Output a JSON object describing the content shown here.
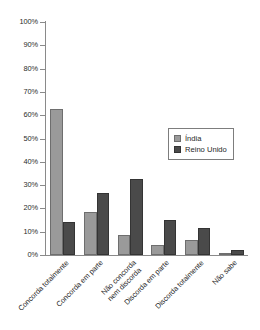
{
  "chart_data": {
    "type": "bar",
    "title": "",
    "subtitle": "",
    "xlabel": "",
    "ylabel": "",
    "ylim": [
      0,
      100
    ],
    "y_tick_labels": [
      "100%",
      "90%",
      "80%",
      "70%",
      "60%",
      "50%",
      "40%",
      "30%",
      "20%",
      "10%",
      "0%"
    ],
    "y_tick_values": [
      100,
      90,
      80,
      70,
      60,
      50,
      40,
      30,
      20,
      10,
      0
    ],
    "grid": false,
    "legend_position": "center-right",
    "categories": [
      "Concorda totalmente",
      "Concorda em parte",
      "Não concorda nem discorda",
      "Discorda em parte",
      "Discorda totalmente",
      "Não sabe"
    ],
    "category_lines": [
      [
        "Concorda totalmente"
      ],
      [
        "Concorda em parte"
      ],
      [
        "Não concorda",
        "nem discorda"
      ],
      [
        "Discorda em parte"
      ],
      [
        "Discorda totalmente"
      ],
      [
        "Não sabe"
      ]
    ],
    "series": [
      {
        "name": "Índia",
        "color": "#9a9a9a",
        "values": [
          62.5,
          18.5,
          8.5,
          4.5,
          6.5,
          0.5
        ]
      },
      {
        "name": "Reino Unido",
        "color": "#4a4a4a",
        "values": [
          14.0,
          26.5,
          32.5,
          15.0,
          11.5,
          2.0
        ]
      }
    ]
  },
  "legend": {
    "items": [
      {
        "label": "Índia",
        "color": "#9a9a9a"
      },
      {
        "label": "Reino Unido",
        "color": "#4a4a4a"
      }
    ]
  },
  "axis": {
    "tick_labels": [
      "100%",
      "90%",
      "80%",
      "70%",
      "60%",
      "50%",
      "40%",
      "30%",
      "20%",
      "10%",
      "0%"
    ]
  }
}
